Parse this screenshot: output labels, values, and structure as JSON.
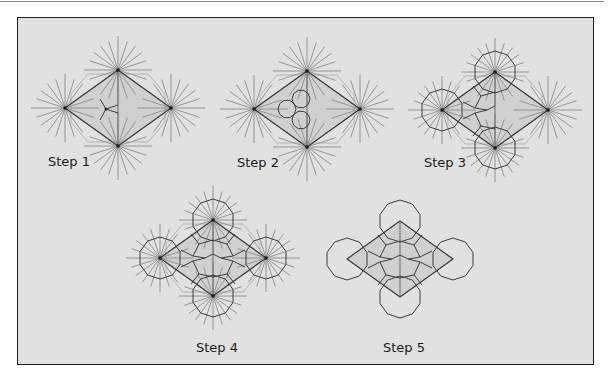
{
  "figure": {
    "colors": {
      "background": "#e1e1e1",
      "frame": "#1e1e1e",
      "ray": "#8c8c8c",
      "edge": "#3a3a3a",
      "fill": "#d0d0d0",
      "polygon": "#3c3c3c"
    },
    "steps": [
      {
        "id": 1,
        "label": "Step 1",
        "center": [
          118,
          108
        ],
        "label_pos": [
          48,
          154
        ],
        "rays": true,
        "decagons": 0,
        "inner": "y-split"
      },
      {
        "id": 2,
        "label": "Step 2",
        "center": [
          307,
          109
        ],
        "label_pos": [
          237,
          155
        ],
        "rays": true,
        "decagons": 0,
        "inner": "three-circles"
      },
      {
        "id": 3,
        "label": "Step 3",
        "center": [
          495,
          110
        ],
        "label_pos": [
          424,
          155
        ],
        "rays": true,
        "decagons": 3,
        "inner": "pentagons-left"
      },
      {
        "id": 4,
        "label": "Step 4",
        "center": [
          213,
          258
        ],
        "label_pos": [
          196,
          340
        ],
        "rays": true,
        "decagons": 4,
        "inner": "pentagons-full"
      },
      {
        "id": 5,
        "label": "Step 5",
        "center": [
          400,
          259
        ],
        "label_pos": [
          383,
          340
        ],
        "rays": false,
        "decagons": 4,
        "inner": "pentagons-full"
      }
    ]
  }
}
